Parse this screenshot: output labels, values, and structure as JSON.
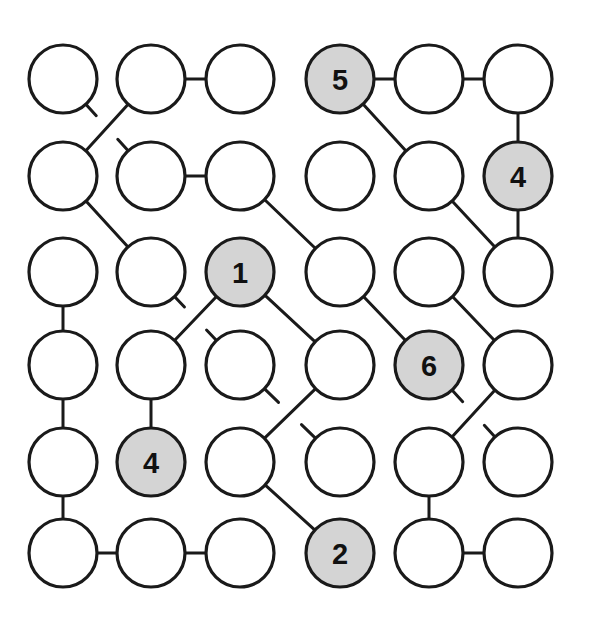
{
  "figure": {
    "kind": "node-link-graph-diagram",
    "title": "",
    "background_color": "#ffffff",
    "node_fill_empty": "#ffffff",
    "node_fill_labeled": "#d4d4d4",
    "node_stroke": "#1a1a1a",
    "edge_stroke": "#1a1a1a",
    "node_radius": 34,
    "node_stroke_width": 3.2,
    "edge_stroke_width": 3.0,
    "grid_rows": 6,
    "grid_cols": 6,
    "col_x": [
      63,
      151,
      240,
      340,
      429,
      518
    ],
    "row_y": [
      79,
      176,
      272,
      365,
      462,
      553
    ]
  },
  "nodes": [
    {
      "id": "r1c1",
      "row": 0,
      "col": 0,
      "label": "",
      "filled": false
    },
    {
      "id": "r1c2",
      "row": 0,
      "col": 1,
      "label": "",
      "filled": false
    },
    {
      "id": "r1c3",
      "row": 0,
      "col": 2,
      "label": "",
      "filled": false
    },
    {
      "id": "r1c4",
      "row": 0,
      "col": 3,
      "label": "5",
      "filled": true
    },
    {
      "id": "r1c5",
      "row": 0,
      "col": 4,
      "label": "",
      "filled": false
    },
    {
      "id": "r1c6",
      "row": 0,
      "col": 5,
      "label": "",
      "filled": false
    },
    {
      "id": "r2c1",
      "row": 1,
      "col": 0,
      "label": "",
      "filled": false
    },
    {
      "id": "r2c2",
      "row": 1,
      "col": 1,
      "label": "",
      "filled": false
    },
    {
      "id": "r2c3",
      "row": 1,
      "col": 2,
      "label": "",
      "filled": false
    },
    {
      "id": "r2c4",
      "row": 1,
      "col": 3,
      "label": "",
      "filled": false
    },
    {
      "id": "r2c5",
      "row": 1,
      "col": 4,
      "label": "",
      "filled": false
    },
    {
      "id": "r2c6",
      "row": 1,
      "col": 5,
      "label": "4",
      "filled": true
    },
    {
      "id": "r3c1",
      "row": 2,
      "col": 0,
      "label": "",
      "filled": false
    },
    {
      "id": "r3c2",
      "row": 2,
      "col": 1,
      "label": "",
      "filled": false
    },
    {
      "id": "r3c3",
      "row": 2,
      "col": 2,
      "label": "1",
      "filled": true
    },
    {
      "id": "r3c4",
      "row": 2,
      "col": 3,
      "label": "",
      "filled": false
    },
    {
      "id": "r3c5",
      "row": 2,
      "col": 4,
      "label": "",
      "filled": false
    },
    {
      "id": "r3c6",
      "row": 2,
      "col": 5,
      "label": "",
      "filled": false
    },
    {
      "id": "r4c1",
      "row": 3,
      "col": 0,
      "label": "",
      "filled": false
    },
    {
      "id": "r4c2",
      "row": 3,
      "col": 1,
      "label": "",
      "filled": false
    },
    {
      "id": "r4c3",
      "row": 3,
      "col": 2,
      "label": "",
      "filled": false
    },
    {
      "id": "r4c4",
      "row": 3,
      "col": 3,
      "label": "",
      "filled": false
    },
    {
      "id": "r4c5",
      "row": 3,
      "col": 4,
      "label": "6",
      "filled": true
    },
    {
      "id": "r4c6",
      "row": 3,
      "col": 5,
      "label": "",
      "filled": false
    },
    {
      "id": "r5c1",
      "row": 4,
      "col": 0,
      "label": "",
      "filled": false
    },
    {
      "id": "r5c2",
      "row": 4,
      "col": 1,
      "label": "4",
      "filled": true
    },
    {
      "id": "r5c3",
      "row": 4,
      "col": 2,
      "label": "",
      "filled": false
    },
    {
      "id": "r5c4",
      "row": 4,
      "col": 3,
      "label": "",
      "filled": false
    },
    {
      "id": "r5c5",
      "row": 4,
      "col": 4,
      "label": "",
      "filled": false
    },
    {
      "id": "r5c6",
      "row": 4,
      "col": 5,
      "label": "",
      "filled": false
    },
    {
      "id": "r6c1",
      "row": 5,
      "col": 0,
      "label": "",
      "filled": false
    },
    {
      "id": "r6c2",
      "row": 5,
      "col": 1,
      "label": "",
      "filled": false
    },
    {
      "id": "r6c3",
      "row": 5,
      "col": 2,
      "label": "",
      "filled": false
    },
    {
      "id": "r6c4",
      "row": 5,
      "col": 3,
      "label": "2",
      "filled": true
    },
    {
      "id": "r6c5",
      "row": 5,
      "col": 4,
      "label": "",
      "filled": false
    },
    {
      "id": "r6c6",
      "row": 5,
      "col": 5,
      "label": "",
      "filled": false
    }
  ],
  "edges": [
    {
      "from": "r1c2",
      "to": "r1c3",
      "style": "solid"
    },
    {
      "from": "r1c4",
      "to": "r1c5",
      "style": "solid"
    },
    {
      "from": "r1c5",
      "to": "r1c6",
      "style": "solid"
    },
    {
      "from": "r1c6",
      "to": "r2c6",
      "style": "solid"
    },
    {
      "from": "r1c2",
      "to": "r2c1",
      "style": "solid"
    },
    {
      "from": "r1c1",
      "to": "r2c2",
      "style": "broken"
    },
    {
      "from": "r1c4",
      "to": "r2c5",
      "style": "solid"
    },
    {
      "from": "r2c2",
      "to": "r2c3",
      "style": "solid"
    },
    {
      "from": "r2c1",
      "to": "r3c2",
      "style": "solid"
    },
    {
      "from": "r2c3",
      "to": "r3c4",
      "style": "solid"
    },
    {
      "from": "r2c5",
      "to": "r3c6",
      "style": "solid"
    },
    {
      "from": "r2c6",
      "to": "r3c6",
      "style": "solid"
    },
    {
      "from": "r3c1",
      "to": "r4c1",
      "style": "solid"
    },
    {
      "from": "r3c3",
      "to": "r4c2",
      "style": "solid"
    },
    {
      "from": "r3c2",
      "to": "r4c3",
      "style": "broken"
    },
    {
      "from": "r3c3",
      "to": "r4c4",
      "style": "solid"
    },
    {
      "from": "r3c4",
      "to": "r4c5",
      "style": "solid"
    },
    {
      "from": "r3c5",
      "to": "r4c6",
      "style": "solid"
    },
    {
      "from": "r4c1",
      "to": "r5c1",
      "style": "solid"
    },
    {
      "from": "r4c2",
      "to": "r5c2",
      "style": "solid"
    },
    {
      "from": "r4c4",
      "to": "r5c3",
      "style": "solid"
    },
    {
      "from": "r4c3",
      "to": "r5c4",
      "style": "broken"
    },
    {
      "from": "r4c6",
      "to": "r5c5",
      "style": "solid"
    },
    {
      "from": "r4c5",
      "to": "r5c6",
      "style": "broken"
    },
    {
      "from": "r5c1",
      "to": "r6c1",
      "style": "solid"
    },
    {
      "from": "r5c3",
      "to": "r6c4",
      "style": "solid"
    },
    {
      "from": "r5c5",
      "to": "r6c5",
      "style": "solid"
    },
    {
      "from": "r6c1",
      "to": "r6c2",
      "style": "solid"
    },
    {
      "from": "r6c2",
      "to": "r6c3",
      "style": "solid"
    },
    {
      "from": "r6c5",
      "to": "r6c6",
      "style": "solid"
    }
  ]
}
